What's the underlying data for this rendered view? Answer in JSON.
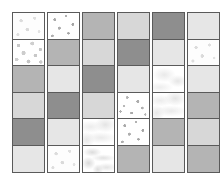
{
  "figure": {
    "name": "texture-swatch-grid",
    "columns_count": 6,
    "rows_count": 6,
    "background_color": "#ffffff",
    "border_color": "#5a5a5a",
    "tones": {
      "dark": "#8e8e8e",
      "medium": "#b4b4b4",
      "light": "#d7d7d7",
      "pale": "#e6e6e6",
      "white": "#fbfbfb"
    }
  },
  "columns": [
    {
      "index": 1,
      "name": "column-1",
      "cells": [
        {
          "name": "cell-r1c1",
          "fill": "tex-dots-light",
          "kind": "texture",
          "label": "light speckle"
        },
        {
          "name": "cell-r2c1",
          "fill": "tex-dots-dense",
          "kind": "texture",
          "label": "dense speckle"
        },
        {
          "name": "cell-r3c1",
          "fill": "t-medium",
          "kind": "solid",
          "label": "medium gray"
        },
        {
          "name": "cell-r4c1",
          "fill": "t-light",
          "kind": "solid",
          "label": "light gray"
        },
        {
          "name": "cell-r5c1",
          "fill": "t-dark",
          "kind": "solid",
          "label": "dark gray"
        },
        {
          "name": "cell-r6c1",
          "fill": "t-pale",
          "kind": "solid",
          "label": "pale gray"
        }
      ]
    },
    {
      "index": 2,
      "name": "column-2",
      "cells": [
        {
          "name": "cell-r1c2",
          "fill": "tex-dots-sparse",
          "kind": "texture",
          "label": "sparse dots"
        },
        {
          "name": "cell-r2c2",
          "fill": "t-medium",
          "kind": "solid",
          "label": "medium gray"
        },
        {
          "name": "cell-r3c2",
          "fill": "t-pale",
          "kind": "solid",
          "label": "pale gray"
        },
        {
          "name": "cell-r4c2",
          "fill": "t-dark",
          "kind": "solid",
          "label": "dark gray"
        },
        {
          "name": "cell-r5c2",
          "fill": "t-pale",
          "kind": "solid",
          "label": "pale gray"
        },
        {
          "name": "cell-r6c2",
          "fill": "tex-dots-light",
          "kind": "texture",
          "label": "light speckle"
        }
      ]
    },
    {
      "index": 3,
      "name": "column-3",
      "cells": [
        {
          "name": "cell-r1c3",
          "fill": "t-medium",
          "kind": "solid",
          "label": "medium gray"
        },
        {
          "name": "cell-r2c3",
          "fill": "t-light",
          "kind": "solid",
          "label": "light gray"
        },
        {
          "name": "cell-r3c3",
          "fill": "t-dark",
          "kind": "solid",
          "label": "dark gray"
        },
        {
          "name": "cell-r4c3",
          "fill": "t-light",
          "kind": "solid",
          "label": "light gray"
        },
        {
          "name": "cell-r5c3",
          "fill": "tex-marble",
          "kind": "texture",
          "label": "marbled"
        },
        {
          "name": "cell-r6c3",
          "fill": "tex-marble-wisp",
          "kind": "texture",
          "label": "wispy marble"
        }
      ]
    },
    {
      "index": 4,
      "name": "column-4",
      "cells": [
        {
          "name": "cell-r1c4",
          "fill": "t-light",
          "kind": "solid",
          "label": "light gray"
        },
        {
          "name": "cell-r2c4",
          "fill": "t-dark",
          "kind": "solid",
          "label": "dark gray"
        },
        {
          "name": "cell-r3c4",
          "fill": "t-pale",
          "kind": "solid",
          "label": "pale gray"
        },
        {
          "name": "cell-r4c4",
          "fill": "tex-dots-scatter",
          "kind": "texture",
          "label": "scattered dots"
        },
        {
          "name": "cell-r5c4",
          "fill": "tex-dots-sparse",
          "kind": "texture",
          "label": "sparse dots"
        },
        {
          "name": "cell-r6c4",
          "fill": "t-medium",
          "kind": "solid",
          "label": "medium gray"
        }
      ]
    },
    {
      "index": 5,
      "name": "column-5",
      "cells": [
        {
          "name": "cell-r1c5",
          "fill": "t-dark",
          "kind": "solid",
          "label": "dark gray"
        },
        {
          "name": "cell-r2c5",
          "fill": "t-pale",
          "kind": "solid",
          "label": "pale gray"
        },
        {
          "name": "cell-r3c5",
          "fill": "tex-marble-soft",
          "kind": "texture",
          "label": "soft marble"
        },
        {
          "name": "cell-r4c5",
          "fill": "tex-marble",
          "kind": "texture",
          "label": "marbled"
        },
        {
          "name": "cell-r5c5",
          "fill": "t-medium",
          "kind": "solid",
          "label": "medium gray"
        },
        {
          "name": "cell-r6c5",
          "fill": "t-pale",
          "kind": "solid",
          "label": "pale gray"
        }
      ]
    },
    {
      "index": 6,
      "name": "column-6",
      "cells": [
        {
          "name": "cell-r1c6",
          "fill": "t-pale",
          "kind": "solid",
          "label": "pale gray"
        },
        {
          "name": "cell-r2c6",
          "fill": "tex-dots-light",
          "kind": "texture",
          "label": "light speckle"
        },
        {
          "name": "cell-r3c6",
          "fill": "t-pale",
          "kind": "solid",
          "label": "pale gray"
        },
        {
          "name": "cell-r4c6",
          "fill": "t-medium",
          "kind": "solid",
          "label": "medium gray"
        },
        {
          "name": "cell-r5c6",
          "fill": "t-light",
          "kind": "solid",
          "label": "light gray"
        },
        {
          "name": "cell-r6c6",
          "fill": "t-medium",
          "kind": "solid",
          "label": "medium gray"
        }
      ]
    }
  ]
}
